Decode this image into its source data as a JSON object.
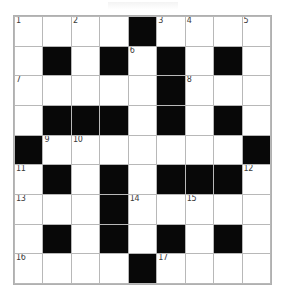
{
  "puzzle": {
    "kind": "crossword-grid",
    "rows": 9,
    "columns": 9,
    "cell_size_px": 29,
    "colors": {
      "block": "#080808",
      "open": "#ffffff",
      "gridline": "#b8b8b8",
      "number_text": "#3a3a3a"
    },
    "clue_numbers_visible": [
      "1",
      "2",
      "3",
      "4",
      "5",
      "6",
      "7",
      "8",
      "9",
      "10",
      "11",
      "12",
      "13",
      "14",
      "15",
      "16",
      "17"
    ],
    "grid": [
      [
        {
          "block": false,
          "number": "1",
          "letter": ""
        },
        {
          "block": false,
          "number": "",
          "letter": ""
        },
        {
          "block": false,
          "number": "2",
          "letter": ""
        },
        {
          "block": false,
          "number": "",
          "letter": ""
        },
        {
          "block": true,
          "number": "",
          "letter": ""
        },
        {
          "block": false,
          "number": "3",
          "letter": ""
        },
        {
          "block": false,
          "number": "4",
          "letter": ""
        },
        {
          "block": false,
          "number": "",
          "letter": ""
        },
        {
          "block": false,
          "number": "5",
          "letter": ""
        }
      ],
      [
        {
          "block": false,
          "number": "",
          "letter": ""
        },
        {
          "block": true,
          "number": "",
          "letter": ""
        },
        {
          "block": false,
          "number": "",
          "letter": ""
        },
        {
          "block": true,
          "number": "",
          "letter": ""
        },
        {
          "block": false,
          "number": "6",
          "letter": ""
        },
        {
          "block": true,
          "number": "",
          "letter": ""
        },
        {
          "block": false,
          "number": "",
          "letter": ""
        },
        {
          "block": true,
          "number": "",
          "letter": ""
        },
        {
          "block": false,
          "number": "",
          "letter": ""
        }
      ],
      [
        {
          "block": false,
          "number": "7",
          "letter": ""
        },
        {
          "block": false,
          "number": "",
          "letter": ""
        },
        {
          "block": false,
          "number": "",
          "letter": ""
        },
        {
          "block": false,
          "number": "",
          "letter": ""
        },
        {
          "block": false,
          "number": "",
          "letter": ""
        },
        {
          "block": true,
          "number": "",
          "letter": ""
        },
        {
          "block": false,
          "number": "8",
          "letter": ""
        },
        {
          "block": false,
          "number": "",
          "letter": ""
        },
        {
          "block": false,
          "number": "",
          "letter": ""
        }
      ],
      [
        {
          "block": false,
          "number": "",
          "letter": ""
        },
        {
          "block": true,
          "number": "",
          "letter": ""
        },
        {
          "block": true,
          "number": "",
          "letter": ""
        },
        {
          "block": true,
          "number": "",
          "letter": ""
        },
        {
          "block": false,
          "number": "",
          "letter": ""
        },
        {
          "block": true,
          "number": "",
          "letter": ""
        },
        {
          "block": false,
          "number": "",
          "letter": ""
        },
        {
          "block": true,
          "number": "",
          "letter": ""
        },
        {
          "block": false,
          "number": "",
          "letter": ""
        }
      ],
      [
        {
          "block": true,
          "number": "",
          "letter": ""
        },
        {
          "block": false,
          "number": "9",
          "letter": ""
        },
        {
          "block": false,
          "number": "10",
          "letter": ""
        },
        {
          "block": false,
          "number": "",
          "letter": ""
        },
        {
          "block": false,
          "number": "",
          "letter": ""
        },
        {
          "block": false,
          "number": "",
          "letter": ""
        },
        {
          "block": false,
          "number": "",
          "letter": ""
        },
        {
          "block": false,
          "number": "",
          "letter": ""
        },
        {
          "block": true,
          "number": "",
          "letter": ""
        }
      ],
      [
        {
          "block": false,
          "number": "11",
          "letter": ""
        },
        {
          "block": true,
          "number": "",
          "letter": ""
        },
        {
          "block": false,
          "number": "",
          "letter": ""
        },
        {
          "block": true,
          "number": "",
          "letter": ""
        },
        {
          "block": false,
          "number": "",
          "letter": ""
        },
        {
          "block": true,
          "number": "",
          "letter": ""
        },
        {
          "block": true,
          "number": "",
          "letter": ""
        },
        {
          "block": true,
          "number": "",
          "letter": ""
        },
        {
          "block": false,
          "number": "12",
          "letter": ""
        }
      ],
      [
        {
          "block": false,
          "number": "13",
          "letter": ""
        },
        {
          "block": false,
          "number": "",
          "letter": ""
        },
        {
          "block": false,
          "number": "",
          "letter": ""
        },
        {
          "block": true,
          "number": "",
          "letter": ""
        },
        {
          "block": false,
          "number": "14",
          "letter": ""
        },
        {
          "block": false,
          "number": "",
          "letter": ""
        },
        {
          "block": false,
          "number": "15",
          "letter": ""
        },
        {
          "block": false,
          "number": "",
          "letter": ""
        },
        {
          "block": false,
          "number": "",
          "letter": ""
        }
      ],
      [
        {
          "block": false,
          "number": "",
          "letter": ""
        },
        {
          "block": true,
          "number": "",
          "letter": ""
        },
        {
          "block": false,
          "number": "",
          "letter": ""
        },
        {
          "block": true,
          "number": "",
          "letter": ""
        },
        {
          "block": false,
          "number": "",
          "letter": ""
        },
        {
          "block": true,
          "number": "",
          "letter": ""
        },
        {
          "block": false,
          "number": "",
          "letter": ""
        },
        {
          "block": true,
          "number": "",
          "letter": ""
        },
        {
          "block": false,
          "number": "",
          "letter": ""
        }
      ],
      [
        {
          "block": false,
          "number": "16",
          "letter": ""
        },
        {
          "block": false,
          "number": "",
          "letter": ""
        },
        {
          "block": false,
          "number": "",
          "letter": ""
        },
        {
          "block": false,
          "number": "",
          "letter": ""
        },
        {
          "block": true,
          "number": "",
          "letter": ""
        },
        {
          "block": false,
          "number": "17",
          "letter": ""
        },
        {
          "block": false,
          "number": "",
          "letter": ""
        },
        {
          "block": false,
          "number": "",
          "letter": ""
        },
        {
          "block": false,
          "number": "",
          "letter": ""
        }
      ]
    ]
  }
}
